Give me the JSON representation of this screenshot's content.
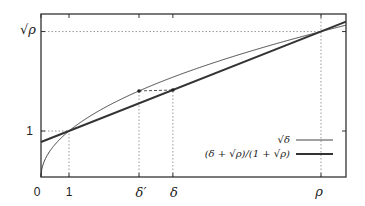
{
  "chart_data": {
    "type": "line",
    "title": "",
    "xlabel": "",
    "ylabel": "",
    "xlim": [
      0,
      10.9
    ],
    "ylim": [
      0,
      3.54
    ],
    "grid": false,
    "legend_position": "lower right (inside)",
    "params": {
      "rho": 10,
      "sqrt_rho": 3.162,
      "delta_prime": 3.5,
      "delta": 4.71
    },
    "x_ticks": [
      {
        "value": 0,
        "label": "0"
      },
      {
        "value": 1,
        "label": "1"
      },
      {
        "value": 3.5,
        "label": "δ′"
      },
      {
        "value": 4.71,
        "label": "δ"
      },
      {
        "value": 10,
        "label": "ρ"
      }
    ],
    "y_ticks": [
      {
        "value": 1,
        "label": "1"
      },
      {
        "value": 3.162,
        "label": "√ρ"
      }
    ],
    "series": [
      {
        "name": "√δ",
        "formula": "sqrt(x)",
        "style": "thin solid",
        "x": [
          0,
          0.05,
          0.2,
          0.5,
          1,
          2,
          3,
          3.5,
          4,
          5,
          6,
          7,
          8,
          9,
          10,
          10.9
        ],
        "values": [
          0,
          0.224,
          0.447,
          0.707,
          1,
          1.414,
          1.732,
          1.871,
          2,
          2.236,
          2.449,
          2.646,
          2.828,
          3,
          3.162,
          3.302
        ]
      },
      {
        "name": "(δ + √ρ)/(1 + √ρ)",
        "formula": "(x + sqrt(rho)) / (1 + sqrt(rho))",
        "style": "thick solid",
        "x": [
          0,
          1,
          4.71,
          10,
          10.9
        ],
        "values": [
          0.76,
          1,
          1.892,
          3.162,
          3.379
        ]
      }
    ],
    "annotations": [
      {
        "type": "dotted-guide",
        "description": "horizontal at y=√ρ from y-axis to x=ρ; vertical at x=ρ"
      },
      {
        "type": "dotted-guide",
        "description": "horizontal at y=1 from y-axis to x=1; vertical at x=1"
      },
      {
        "type": "dotted-guide",
        "description": "vertical at x=δ′ from axis to √δ′ point"
      },
      {
        "type": "dotted-guide",
        "description": "vertical at x=δ from axis to line point"
      },
      {
        "type": "dashed-connector",
        "description": "horizontal from (δ′, √δ′) to (δ, line(δ)), both marked with dots"
      }
    ]
  },
  "labels": {
    "x0": "0",
    "x1": "1",
    "x_delta_prime": "δ′",
    "x_delta": "δ",
    "x_rho": "ρ",
    "y1": "1",
    "y_sqrt_rho": "√ρ",
    "legend_sqrt": "√δ",
    "legend_line": "(δ + √ρ)/(1 + √ρ)"
  },
  "colors": {
    "axes": "#333333",
    "curve": "#444444",
    "line": "#333333",
    "guides": "#999999",
    "text": "#222222"
  }
}
